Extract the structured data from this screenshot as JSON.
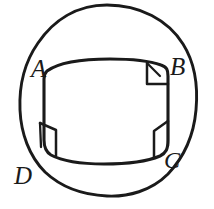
{
  "figure": {
    "kind": "geometry-diagram",
    "background_color": "#ffffff",
    "stroke_color": "#1a1a1a",
    "label_color": "#1a1a1a",
    "labels": [
      {
        "id": "A",
        "text": "A",
        "position": "top-left-vertex"
      },
      {
        "id": "B",
        "text": "B",
        "position": "top-right-vertex"
      },
      {
        "id": "C",
        "text": "C",
        "position": "bottom-right-vertex"
      },
      {
        "id": "D",
        "text": "D",
        "position": "outside-lower-left"
      }
    ],
    "shapes": {
      "outer_circle_name": "circle",
      "inner_quad_name": "quadrilateral-ABCD"
    },
    "right_angle_marks": [
      {
        "id": "mark-b",
        "at": "top-right-corner"
      },
      {
        "id": "mark-bottom-left",
        "at": "bottom-left-corner"
      },
      {
        "id": "mark-bottom-right",
        "at": "bottom-right-corner"
      }
    ]
  }
}
